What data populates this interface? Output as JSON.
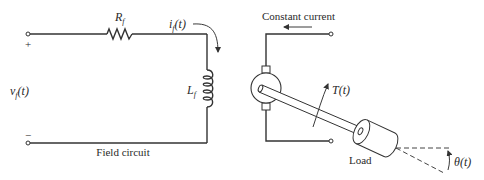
{
  "diagram": {
    "field_circuit": {
      "caption": "Field circuit",
      "resistor": {
        "symbol": "R",
        "subscript": "f"
      },
      "inductor": {
        "symbol": "L",
        "subscript": "f"
      },
      "current": {
        "symbol": "i",
        "subscript": "f",
        "arg": "(t)"
      },
      "voltage": {
        "symbol": "v",
        "subscript": "f",
        "arg": "(t)"
      },
      "plus_sign": "+",
      "minus_sign": "−"
    },
    "armature": {
      "constant_current_label": "Constant current",
      "torque": {
        "symbol": "T",
        "arg": "(t)"
      },
      "load_label": "Load",
      "angle": {
        "symbol": "θ",
        "arg": "(t)"
      }
    },
    "colors": {
      "line": "#333333",
      "text": "#2a2a2a",
      "background": "#ffffff"
    }
  }
}
